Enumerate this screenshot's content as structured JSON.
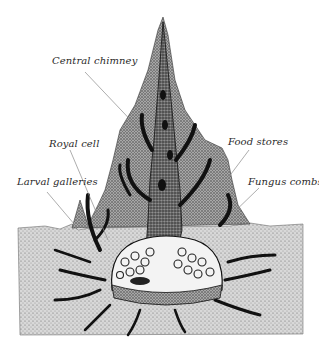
{
  "figure": {
    "labels": [
      {
        "id": "central-chimney",
        "text": "Central chimney",
        "x": 52,
        "y": 56
      },
      {
        "id": "royal-cell",
        "text": "Royal cell",
        "x": 49,
        "y": 139
      },
      {
        "id": "larval-galleries",
        "text": "Larval galleries",
        "x": 17,
        "y": 177
      },
      {
        "id": "food-stores",
        "text": "Food stores",
        "x": 228,
        "y": 137
      },
      {
        "id": "fungus-combs",
        "text": "Fungus combs",
        "x": 248,
        "y": 177
      }
    ],
    "colors": {
      "ink": "#1a1a1a",
      "soil": "#cfcfcf",
      "mound": "#bdbdbd",
      "chamber": "#f4f4f4",
      "leader_line": "#8a8a8a"
    }
  }
}
